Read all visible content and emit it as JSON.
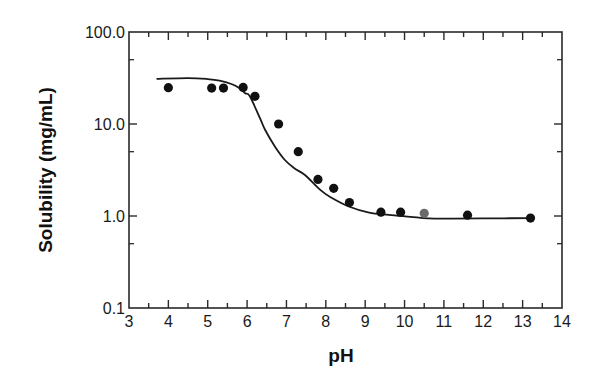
{
  "chart_data": {
    "type": "scatter",
    "title": "",
    "xlabel": "pH",
    "ylabel": "Solubility (mg/mL)",
    "xlim": [
      3,
      14
    ],
    "ylim": [
      0.1,
      100.0
    ],
    "yscale": "log",
    "grid": false,
    "legend": null,
    "x_ticks": [
      3,
      4,
      5,
      6,
      7,
      8,
      9,
      10,
      11,
      12,
      13,
      14
    ],
    "x_tick_labels": [
      "3",
      "4",
      "5",
      "6",
      "7",
      "8",
      "9",
      "10",
      "11",
      "12",
      "13",
      "14"
    ],
    "y_ticks": [
      0.1,
      1.0,
      10.0,
      100.0
    ],
    "y_tick_labels": [
      "0.1",
      "1.0",
      "10.0",
      "100.0"
    ],
    "y_minor_ticks": [
      0.5,
      5,
      50
    ],
    "series": [
      {
        "name": "measured",
        "kind": "scatter",
        "color": "#111111",
        "x": [
          4.0,
          5.1,
          5.4,
          5.9,
          6.2,
          6.8,
          7.3,
          7.8,
          8.2,
          8.6,
          9.4,
          9.9,
          10.5,
          11.6,
          13.2
        ],
        "y": [
          24.8,
          24.6,
          24.6,
          25.0,
          20.0,
          10.0,
          5.0,
          2.5,
          2.0,
          1.4,
          1.1,
          1.1,
          1.07,
          1.02,
          0.95
        ],
        "point_colors": [
          "#111111",
          "#111111",
          "#111111",
          "#111111",
          "#111111",
          "#111111",
          "#111111",
          "#111111",
          "#111111",
          "#111111",
          "#111111",
          "#111111",
          "#6a6a6a",
          "#111111",
          "#111111"
        ]
      },
      {
        "name": "fit",
        "kind": "line",
        "color": "#1a1a1a",
        "x": [
          3.7,
          4.5,
          5.0,
          5.3,
          5.6,
          5.8,
          5.95,
          6.07,
          6.33,
          6.46,
          6.71,
          6.96,
          7.2,
          7.47,
          7.86,
          8.1,
          8.6,
          9.1,
          9.6,
          10.15,
          10.6,
          11.2,
          12.0,
          13.2
        ],
        "y": [
          31.0,
          31.6,
          30.8,
          29.6,
          27.2,
          24.6,
          21.6,
          20.0,
          11.5,
          8.6,
          5.66,
          4.06,
          3.3,
          2.79,
          1.92,
          1.62,
          1.26,
          1.09,
          1.03,
          0.98,
          0.94,
          0.935,
          0.94,
          0.95
        ]
      }
    ]
  }
}
